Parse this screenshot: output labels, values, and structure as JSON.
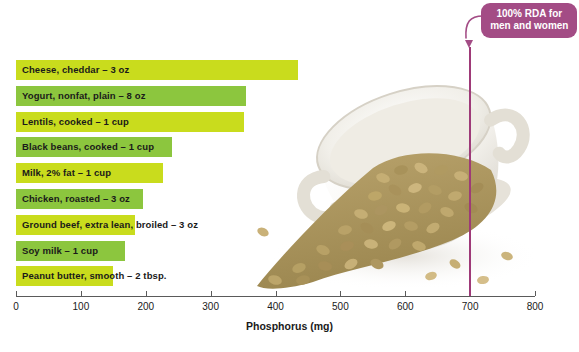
{
  "chart_data": {
    "type": "bar",
    "title": "",
    "xlabel": "Phosphorus (mg)",
    "ylabel": "",
    "orientation": "horizontal",
    "xlim": [
      0,
      800
    ],
    "xticks": [
      0,
      100,
      200,
      300,
      400,
      500,
      600,
      700,
      800
    ],
    "xtick_labels": [
      "0",
      "100",
      "200",
      "300",
      "400",
      "500",
      "600",
      "700",
      "800"
    ],
    "grid": false,
    "legend": "none",
    "categories": [
      "Cheese, cheddar – 3 oz",
      "Yogurt, nonfat, plain – 8 oz",
      "Lentils, cooked – 1 cup",
      "Black beans, cooked – 1 cup",
      "Milk, 2% fat – 1 cup",
      "Chicken, roasted – 3 oz",
      "Ground beef, extra lean, broiled – 3 oz",
      "Soy milk – 1 cup",
      "Peanut butter, smooth – 2 tbsp."
    ],
    "values": [
      435,
      355,
      352,
      241,
      227,
      196,
      183,
      168,
      150
    ],
    "bar_colors": [
      "#c9dc1d",
      "#8cc63e",
      "#c9dc1d",
      "#8cc63e",
      "#c9dc1d",
      "#8cc63e",
      "#c9dc1d",
      "#8cc63e",
      "#c9dc1d"
    ],
    "annotations": [
      {
        "name": "rda-marker",
        "text": "100% RDA for men and women",
        "value": 700,
        "color": "#a34c85"
      }
    ]
  },
  "axis": {
    "title": "Phosphorus (mg)",
    "ticks": [
      "0",
      "100",
      "200",
      "300",
      "400",
      "500",
      "600",
      "700",
      "800"
    ]
  },
  "bars": [
    {
      "label": "Cheese, cheddar – 3 oz",
      "value": 435
    },
    {
      "label": "Yogurt, nonfat, plain – 8 oz",
      "value": 355
    },
    {
      "label": "Lentils, cooked – 1 cup",
      "value": 352
    },
    {
      "label": "Black beans, cooked – 1 cup",
      "value": 241
    },
    {
      "label": "Milk, 2% fat – 1 cup",
      "value": 227
    },
    {
      "label": "Chicken, roasted – 3 oz",
      "value": 196
    },
    {
      "label": "Ground beef, extra lean, broiled – 3 oz",
      "value": 183
    },
    {
      "label": "Soy milk – 1 cup",
      "value": 168
    },
    {
      "label": "Peanut butter, smooth – 2 tbsp.",
      "value": 150
    }
  ],
  "rda": {
    "line1": "100% RDA for",
    "line2": "men and women",
    "value": 700
  },
  "colors": {
    "bar_light": "#c9dc1d",
    "bar_dark": "#8cc63e",
    "rda_box": "#a34c85",
    "rda_line": "#9e3a78",
    "axis": "#5a5a5a",
    "text": "#1a1a1a"
  },
  "photo": {
    "alt": "white bowl tipped on its side with brown lentils spilling out"
  }
}
